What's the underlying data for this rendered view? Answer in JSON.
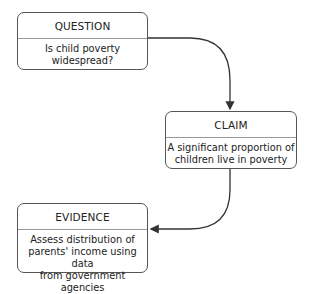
{
  "diagram": {
    "nodes": [
      {
        "id": "question",
        "title": "QUESTION",
        "body": [
          "Is child poverty",
          "widespread?"
        ]
      },
      {
        "id": "claim",
        "title": "CLAIM",
        "body": [
          "A significant proportion of",
          "children live in poverty"
        ]
      },
      {
        "id": "evidence",
        "title": "EVIDENCE",
        "body": [
          "Assess distribution of",
          "parents' income using data",
          "from government agencies"
        ]
      }
    ],
    "edges": [
      {
        "from": "question",
        "to": "claim"
      },
      {
        "from": "claim",
        "to": "evidence"
      }
    ],
    "colors": {
      "stroke": "#333333",
      "divider": "#999999",
      "background": "#ffffff"
    }
  }
}
